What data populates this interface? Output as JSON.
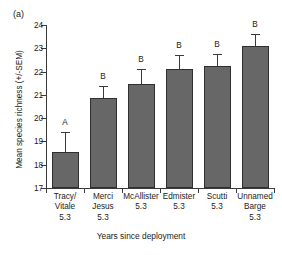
{
  "figure": {
    "panel_label": "(a)",
    "bar_color": "#676767",
    "axis_color": "#3a3a3a"
  },
  "chart_data": {
    "type": "bar",
    "title": "",
    "panel": "(a)",
    "xlabel": "Years since deployment",
    "ylabel": "Mean species richness (+/-SEM)",
    "ylim": [
      17,
      24
    ],
    "yticks": [
      17,
      18,
      19,
      20,
      21,
      22,
      23,
      24
    ],
    "ytick_labels": [
      "17",
      "18",
      "19",
      "20",
      "21",
      "22",
      "23",
      "24"
    ],
    "grid": false,
    "legend": "none",
    "categories": [
      "Tracy/ Vitale 5.3",
      "Merci Jesus 5.3",
      "McAllister 5.3",
      "Edmister 5.3",
      "Scutti 5.3",
      "Unnamed Barge 5.3"
    ],
    "category_lines": [
      [
        "Tracy/",
        "Vitale",
        "5.3"
      ],
      [
        "Merci",
        "Jesus",
        "5.3"
      ],
      [
        "McAllister",
        "5.3"
      ],
      [
        "Edmister",
        "5.3"
      ],
      [
        "Scutti",
        "5.3"
      ],
      [
        "Unnamed",
        "Barge",
        "5.3"
      ]
    ],
    "values": [
      18.55,
      20.87,
      21.48,
      22.13,
      22.24,
      23.1
    ],
    "errors": [
      0.85,
      0.5,
      0.65,
      0.57,
      0.52,
      0.52
    ],
    "annotations": [
      "A",
      "B",
      "B",
      "B",
      "B",
      "B"
    ]
  }
}
